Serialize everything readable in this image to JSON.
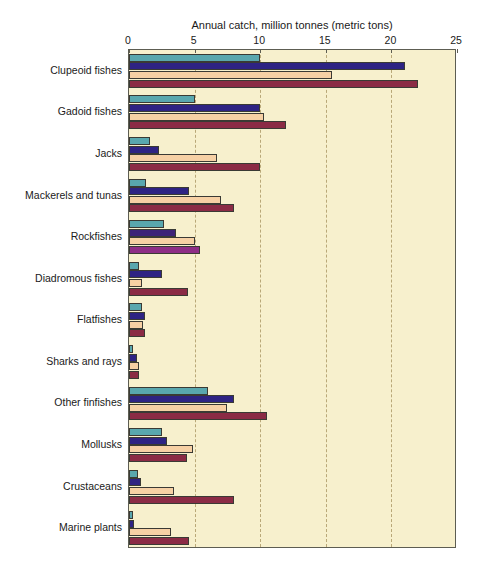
{
  "chart_data": {
    "type": "bar",
    "orientation": "horizontal",
    "title": "Annual catch, million tonnes (metric tons)",
    "xlabel": "Annual catch, million tonnes (metric tons)",
    "ylabel": "",
    "xlim": [
      0,
      25
    ],
    "xticks": [
      0,
      5,
      10,
      15,
      20,
      25
    ],
    "xtick_labels": [
      "0",
      "5",
      "10",
      "15",
      "20",
      "25"
    ],
    "grid": true,
    "grid_axis": "x",
    "grid_style": "dashed",
    "legend": false,
    "legend_position": "none",
    "plot_background": "#f7f0cd",
    "categories": [
      "Clupeoid fishes",
      "Gadoid fishes",
      "Jacks",
      "Mackerels and tunas",
      "Rockfishes",
      "Diadromous fishes",
      "Flatfishes",
      "Sharks and rays",
      "Other finfishes",
      "Mollusks",
      "Crustaceans",
      "Marine plants"
    ],
    "series": [
      {
        "name": "series-1",
        "color": "#59a7ae",
        "values": [
          10.0,
          5.0,
          1.6,
          1.3,
          2.7,
          0.8,
          1.0,
          0.3,
          6.0,
          2.5,
          0.7,
          0.3
        ]
      },
      {
        "name": "series-2",
        "color": "#2e2383",
        "values": [
          21.0,
          10.0,
          2.3,
          4.6,
          3.6,
          2.5,
          1.2,
          0.6,
          8.0,
          2.9,
          0.9,
          0.4
        ]
      },
      {
        "name": "series-3",
        "color": "#f6d0a4",
        "values": [
          15.5,
          10.3,
          6.7,
          7.0,
          5.0,
          1.0,
          1.1,
          0.8,
          7.5,
          4.9,
          3.4,
          3.2
        ]
      },
      {
        "name": "series-4",
        "color": "#8b2b45",
        "values": [
          22.0,
          12.0,
          10.0,
          8.0,
          5.4,
          4.5,
          1.2,
          0.8,
          10.5,
          4.4,
          8.0,
          4.6
        ]
      }
    ],
    "tinted_category_index": 4
  }
}
